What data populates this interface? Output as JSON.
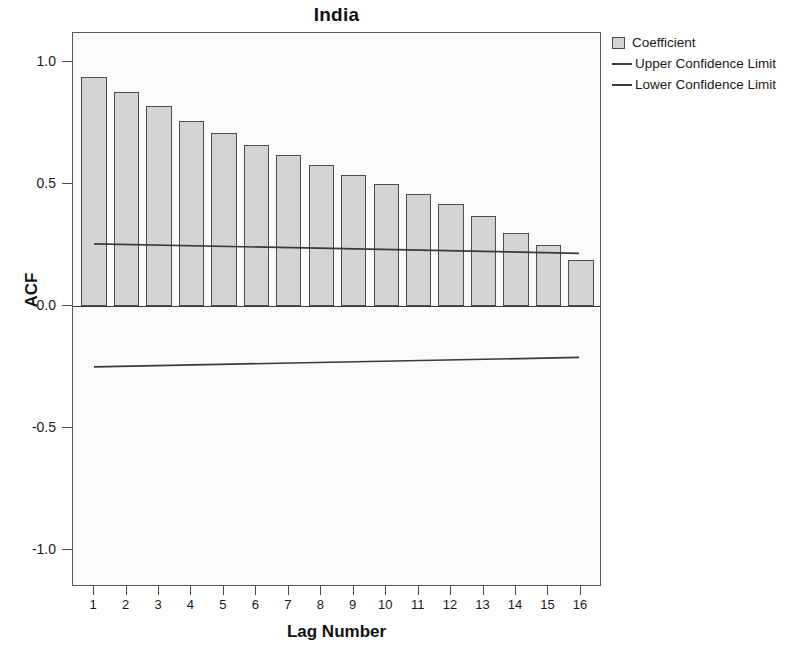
{
  "chart_data": {
    "type": "bar",
    "title": "India",
    "xlabel": "Lag Number",
    "ylabel": "ACF",
    "categories": [
      1,
      2,
      3,
      4,
      5,
      6,
      7,
      8,
      9,
      10,
      11,
      12,
      13,
      14,
      15,
      16
    ],
    "values": [
      0.94,
      0.88,
      0.82,
      0.76,
      0.71,
      0.66,
      0.62,
      0.58,
      0.54,
      0.5,
      0.46,
      0.42,
      0.37,
      0.3,
      0.25,
      0.19
    ],
    "series": [
      {
        "name": "Coefficient",
        "type": "bar",
        "values": [
          0.94,
          0.88,
          0.82,
          0.76,
          0.71,
          0.66,
          0.62,
          0.58,
          0.54,
          0.5,
          0.46,
          0.42,
          0.37,
          0.3,
          0.25,
          0.19
        ]
      },
      {
        "name": "Upper Confidence Limit",
        "type": "line",
        "values": [
          0.253,
          0.25,
          0.248,
          0.245,
          0.243,
          0.24,
          0.238,
          0.235,
          0.232,
          0.23,
          0.227,
          0.225,
          0.222,
          0.22,
          0.217,
          0.214
        ]
      },
      {
        "name": "Lower Confidence Limit",
        "type": "line",
        "values": [
          -0.253,
          -0.25,
          -0.248,
          -0.245,
          -0.243,
          -0.24,
          -0.238,
          -0.235,
          -0.232,
          -0.23,
          -0.227,
          -0.225,
          -0.222,
          -0.22,
          -0.217,
          -0.214
        ]
      }
    ],
    "ylim": [
      -1.15,
      1.12
    ],
    "xlim": [
      0.35,
      16.65
    ],
    "yticks": [
      1.0,
      0.5,
      0.0,
      -0.5,
      -1.0
    ],
    "ytick_labels": [
      "1.0",
      "0.5",
      "0.0",
      "-0.5",
      "-1.0"
    ],
    "xtick_labels": [
      "1",
      "2",
      "3",
      "4",
      "5",
      "6",
      "7",
      "8",
      "9",
      "10",
      "11",
      "12",
      "13",
      "14",
      "15",
      "16"
    ],
    "grid": false,
    "legend_position": "right",
    "bar_fill_color": "#d4d4d4",
    "bar_edge_color": "#4d4d4d",
    "line_color": "#3a3a3a",
    "plot_background": "#fbfbfb",
    "figure_background": "#ffffff"
  },
  "legend": {
    "items": [
      {
        "label": "Coefficient",
        "marker": "box-swatch-icon"
      },
      {
        "label": "Upper Confidence Limit",
        "marker": "line-swatch-icon"
      },
      {
        "label": "Lower Confidence Limit",
        "marker": "line-swatch-icon"
      }
    ]
  }
}
